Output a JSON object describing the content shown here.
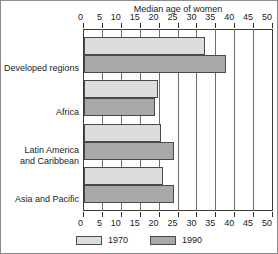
{
  "chart_data": {
    "type": "bar",
    "orientation": "horizontal",
    "title": "Median age of women",
    "xlabel": "",
    "ylabel": "",
    "xlim": [
      0,
      50
    ],
    "xticks": [
      0,
      5,
      10,
      15,
      20,
      25,
      30,
      35,
      40,
      45,
      50
    ],
    "xticklabels": [
      "0",
      "5",
      "10",
      "15",
      "20",
      "25",
      "30",
      "35",
      "40",
      "45",
      "50"
    ],
    "grid": true,
    "grid_axis": "x",
    "axis_labels_position": "top-and-bottom",
    "legend_position": "bottom-center",
    "categories": [
      "Developed regions",
      "Africa",
      "Latin America and Caribbean",
      "Asia and Pacific"
    ],
    "series": [
      {
        "name": "1970",
        "color": "#dcdcdc",
        "values": [
          32.0,
          19.7,
          20.5,
          20.8
        ]
      },
      {
        "name": "1990",
        "color": "#a8a8a8",
        "values": [
          37.5,
          18.8,
          23.8,
          23.9
        ]
      }
    ]
  },
  "category_label_lines": [
    [
      "Developed regions"
    ],
    [
      "Africa"
    ],
    [
      "Latin America",
      "and Caribbean"
    ],
    [
      "Asia and Pacific"
    ]
  ],
  "legend": {
    "items": [
      {
        "label": "1970",
        "color": "#dcdcdc"
      },
      {
        "label": "1990",
        "color": "#a8a8a8"
      }
    ]
  },
  "colors": {
    "series_1970": "#dcdcdc",
    "series_1990": "#a8a8a8",
    "bar_outline": "#4a4a4a",
    "gridline": "#6e6e6e",
    "axis": "#3a3a3a",
    "text": "#1b1b1b",
    "figure_border": "#8c8c8c",
    "background": "#ffffff"
  }
}
